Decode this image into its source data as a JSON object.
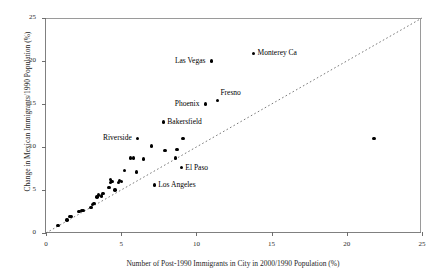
{
  "chart_data": {
    "type": "scatter",
    "title": "",
    "xlabel": "Number of Post-1990 Immigrants in City in 2000/1990 Population (%)",
    "ylabel": "Change in Mexican Immigrants/1990 Population (%)",
    "xlim": [
      0,
      25
    ],
    "ylim": [
      0,
      25
    ],
    "xticks": [
      0,
      5,
      10,
      15,
      20,
      25
    ],
    "yticks": [
      0,
      5,
      10,
      15,
      20,
      25
    ],
    "xtick_labels": [
      "0",
      "5",
      "10",
      "15",
      "20",
      "25"
    ],
    "ytick_labels": [
      "0",
      "5",
      "10",
      "15",
      "20",
      "25"
    ],
    "grid": false,
    "legend": null,
    "reference_line": {
      "name": "45-degree-line",
      "style": "dotted",
      "from": [
        0,
        0
      ],
      "to": [
        25,
        25
      ]
    },
    "points": [
      {
        "x": 0.8,
        "y": 0.9,
        "label": ""
      },
      {
        "x": 1.4,
        "y": 1.5,
        "label": ""
      },
      {
        "x": 1.6,
        "y": 1.9,
        "label": ""
      },
      {
        "x": 1.7,
        "y": 1.9,
        "label": ""
      },
      {
        "x": 2.2,
        "y": 2.5,
        "label": ""
      },
      {
        "x": 2.4,
        "y": 2.6,
        "label": ""
      },
      {
        "x": 2.5,
        "y": 2.6,
        "label": ""
      },
      {
        "x": 3.0,
        "y": 3.0,
        "label": ""
      },
      {
        "x": 3.1,
        "y": 3.3,
        "label": ""
      },
      {
        "x": 3.2,
        "y": 3.4,
        "label": ""
      },
      {
        "x": 3.4,
        "y": 4.2,
        "label": ""
      },
      {
        "x": 3.5,
        "y": 4.4,
        "label": ""
      },
      {
        "x": 3.7,
        "y": 4.3,
        "label": ""
      },
      {
        "x": 3.8,
        "y": 4.6,
        "label": ""
      },
      {
        "x": 4.2,
        "y": 5.3,
        "label": ""
      },
      {
        "x": 4.3,
        "y": 5.9,
        "label": ""
      },
      {
        "x": 4.3,
        "y": 6.2,
        "label": ""
      },
      {
        "x": 4.4,
        "y": 6.0,
        "label": ""
      },
      {
        "x": 4.6,
        "y": 5.0,
        "label": ""
      },
      {
        "x": 4.8,
        "y": 5.9,
        "label": ""
      },
      {
        "x": 4.9,
        "y": 6.1,
        "label": ""
      },
      {
        "x": 5.0,
        "y": 6.0,
        "label": ""
      },
      {
        "x": 5.2,
        "y": 7.3,
        "label": ""
      },
      {
        "x": 5.6,
        "y": 8.7,
        "label": ""
      },
      {
        "x": 5.8,
        "y": 8.7,
        "label": ""
      },
      {
        "x": 6.0,
        "y": 7.1,
        "label": ""
      },
      {
        "x": 6.1,
        "y": 11.0,
        "label": "Riverside"
      },
      {
        "x": 6.5,
        "y": 8.6,
        "label": ""
      },
      {
        "x": 7.0,
        "y": 10.1,
        "label": ""
      },
      {
        "x": 7.2,
        "y": 5.6,
        "label": "Los Angeles"
      },
      {
        "x": 7.8,
        "y": 12.9,
        "label": "Bakersfield"
      },
      {
        "x": 7.9,
        "y": 9.6,
        "label": ""
      },
      {
        "x": 8.6,
        "y": 8.7,
        "label": ""
      },
      {
        "x": 8.7,
        "y": 9.7,
        "label": ""
      },
      {
        "x": 9.0,
        "y": 7.6,
        "label": "El Paso"
      },
      {
        "x": 9.1,
        "y": 11.0,
        "label": ""
      },
      {
        "x": 10.6,
        "y": 15.0,
        "label": "Phoenix"
      },
      {
        "x": 11.4,
        "y": 15.4,
        "label": "Fresno"
      },
      {
        "x": 11.0,
        "y": 20.0,
        "label": "Las Vegas"
      },
      {
        "x": 13.8,
        "y": 20.9,
        "label": "Monterey Ca"
      },
      {
        "x": 21.8,
        "y": 11.0,
        "label": ""
      }
    ],
    "annotations": [
      {
        "text": "Las Vegas",
        "anchor_point": [
          11.0,
          20.0
        ],
        "placement": "left"
      },
      {
        "text": "Monterey Ca",
        "anchor_point": [
          13.8,
          20.9
        ],
        "placement": "right"
      },
      {
        "text": "Fresno",
        "anchor_point": [
          11.4,
          15.4
        ],
        "placement": "above-right"
      },
      {
        "text": "Phoenix",
        "anchor_point": [
          10.6,
          15.0
        ],
        "placement": "left"
      },
      {
        "text": "Bakersfield",
        "anchor_point": [
          7.8,
          12.9
        ],
        "placement": "right"
      },
      {
        "text": "Riverside",
        "anchor_point": [
          6.1,
          11.0
        ],
        "placement": "left"
      },
      {
        "text": "El Paso",
        "anchor_point": [
          9.0,
          7.6
        ],
        "placement": "right"
      },
      {
        "text": "Los Angeles",
        "anchor_point": [
          7.2,
          5.6
        ],
        "placement": "right"
      }
    ],
    "colors": {
      "marker": "#000000",
      "axis": "#808080",
      "reference_line": "#7a7a7a",
      "background": "#ffffff"
    }
  }
}
